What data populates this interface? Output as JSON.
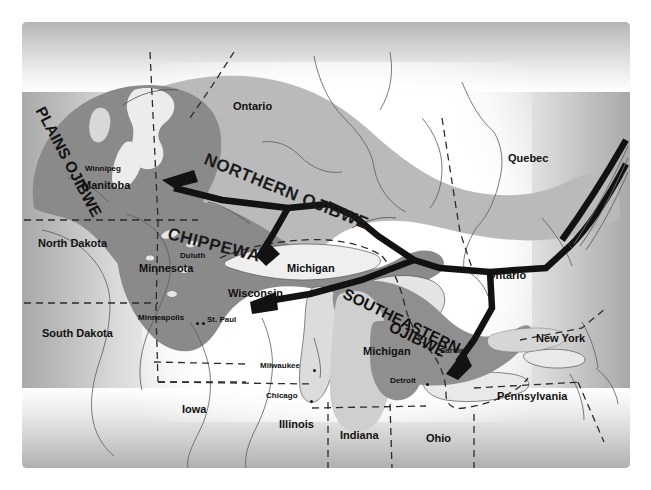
{
  "map": {
    "title": "Ojibwe migration and territory map",
    "frame": {
      "x": 22,
      "y": 22,
      "width": 608,
      "height": 446
    },
    "palette": {
      "territory_light": "#b9b9b9",
      "territory_dark": "#878787",
      "lake_fill": "#d4d4d4",
      "arrow": "#141414",
      "border_line": "#2b2b2b",
      "text": "#111111",
      "paper": "#ffffff",
      "vignette": "#a9a9a9"
    },
    "regions": [
      {
        "id": "plains-ojibwe",
        "label": "PLAINS OJIBWE",
        "x": 40,
        "y": 100,
        "rotate": 62,
        "size": "region-sm"
      },
      {
        "id": "northern-ojibwe",
        "label": "NORTHERN OJIBWE",
        "x": 205,
        "y": 150,
        "rotate": 22,
        "size": "region"
      },
      {
        "id": "chippewa",
        "label": "CHIPPEWA",
        "x": 168,
        "y": 225,
        "rotate": 14,
        "size": "region"
      },
      {
        "id": "southeastern",
        "label": "SOUTHEASTERN",
        "x": 344,
        "y": 285,
        "rotate": 26,
        "size": "region-sm"
      },
      {
        "id": "southeastern-ojibwe",
        "label": "OJIBWE",
        "x": 390,
        "y": 318,
        "rotate": 26,
        "size": "region-sm"
      }
    ],
    "provinces_states": [
      {
        "id": "ontario-north",
        "label": "Ontario",
        "x": 233,
        "y": 101,
        "cls": "state"
      },
      {
        "id": "quebec",
        "label": "Quebec",
        "x": 508,
        "y": 153,
        "cls": "state"
      },
      {
        "id": "manitoba",
        "label": "Manitoba",
        "x": 82,
        "y": 180,
        "cls": "state"
      },
      {
        "id": "north-dakota",
        "label": "North Dakota",
        "x": 38,
        "y": 238,
        "cls": "state"
      },
      {
        "id": "south-dakota",
        "label": "South Dakota",
        "x": 42,
        "y": 328,
        "cls": "state"
      },
      {
        "id": "minnesota",
        "label": "Minnesota",
        "x": 139,
        "y": 263,
        "cls": "state"
      },
      {
        "id": "wisconsin",
        "label": "Wisconsin",
        "x": 228,
        "y": 288,
        "cls": "state"
      },
      {
        "id": "michigan-lake",
        "label": "Michigan",
        "x": 287,
        "y": 263,
        "cls": "state"
      },
      {
        "id": "michigan-state",
        "label": "Michigan",
        "x": 363,
        "y": 346,
        "cls": "state"
      },
      {
        "id": "ontario-south",
        "label": "Ontario",
        "x": 487,
        "y": 270,
        "cls": "state"
      },
      {
        "id": "new-york",
        "label": "New York",
        "x": 536,
        "y": 333,
        "cls": "state"
      },
      {
        "id": "pennsylvania",
        "label": "Pennsylvania",
        "x": 497,
        "y": 391,
        "cls": "state"
      },
      {
        "id": "iowa",
        "label": "Iowa",
        "x": 182,
        "y": 404,
        "cls": "state"
      },
      {
        "id": "illinois",
        "label": "Illinois",
        "x": 279,
        "y": 419,
        "cls": "state"
      },
      {
        "id": "indiana",
        "label": "Indiana",
        "x": 340,
        "y": 430,
        "cls": "state"
      },
      {
        "id": "ohio",
        "label": "Ohio",
        "x": 426,
        "y": 433,
        "cls": "state"
      }
    ],
    "cities": [
      {
        "id": "winnipeg",
        "label": "Winnipeg",
        "x": 85,
        "y": 165,
        "dot": null
      },
      {
        "id": "duluth",
        "label": "Duluth",
        "x": 180,
        "y": 252,
        "dot": null
      },
      {
        "id": "minneapolis",
        "label": "Minneapolis",
        "x": 138,
        "y": 314,
        "dot": {
          "x": 196,
          "y": 318
        }
      },
      {
        "id": "st-paul",
        "label": "St. Paul",
        "x": 207,
        "y": 316,
        "dot": {
          "x": 202,
          "y": 318
        }
      },
      {
        "id": "milwaukee",
        "label": "Milwaukee",
        "x": 260,
        "y": 362,
        "dot": {
          "x": 313,
          "y": 365
        }
      },
      {
        "id": "chicago",
        "label": "Chicago",
        "x": 266,
        "y": 392,
        "dot": {
          "x": 310,
          "y": 396
        }
      },
      {
        "id": "sarnia",
        "label": "Sarnia",
        "x": 440,
        "y": 347,
        "dot": {
          "x": 437,
          "y": 349
        }
      },
      {
        "id": "detroit",
        "label": "Detroit",
        "x": 390,
        "y": 377,
        "dot": {
          "x": 426,
          "y": 379
        }
      }
    ],
    "migration_arrows": [
      {
        "id": "arrow-to-manitoba",
        "description": "eastern origin west to Manitoba / Winnipeg"
      },
      {
        "id": "arrow-to-wisconsin",
        "description": "branch southwest to Wisconsin / Lake Superior"
      },
      {
        "id": "arrow-to-detroit",
        "description": "branch south to Sarnia / Detroit"
      },
      {
        "id": "arrow-origin-east",
        "description": "converging routes entering from the St. Lawrence, east edge"
      }
    ]
  }
}
